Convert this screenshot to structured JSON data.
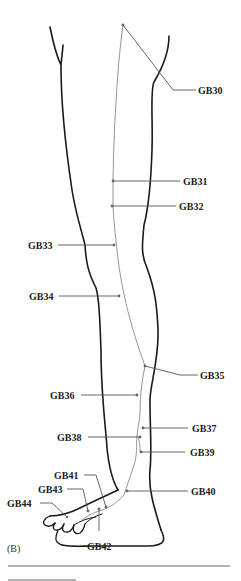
{
  "figure": {
    "panel_label": "(B)",
    "colors": {
      "outline": "#1a1a1a",
      "meridian": "#8a8a8a",
      "leader": "#555555",
      "text": "#222222"
    }
  },
  "points": [
    {
      "label": "GB30",
      "side": "right"
    },
    {
      "label": "GB31",
      "side": "right"
    },
    {
      "label": "GB32",
      "side": "right"
    },
    {
      "label": "GB33",
      "side": "left"
    },
    {
      "label": "GB34",
      "side": "left"
    },
    {
      "label": "GB35",
      "side": "right"
    },
    {
      "label": "GB36",
      "side": "left"
    },
    {
      "label": "GB37",
      "side": "right"
    },
    {
      "label": "GB38",
      "side": "left"
    },
    {
      "label": "GB39",
      "side": "right"
    },
    {
      "label": "GB40",
      "side": "right"
    },
    {
      "label": "GB41",
      "side": "left"
    },
    {
      "label": "GB42",
      "side": "bottom"
    },
    {
      "label": "GB43",
      "side": "left"
    },
    {
      "label": "GB44",
      "side": "left"
    }
  ]
}
